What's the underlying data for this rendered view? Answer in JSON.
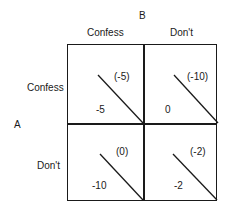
{
  "player_b": {
    "label": "B",
    "strategies": [
      "Confess",
      "Don't"
    ]
  },
  "player_a": {
    "label": "A",
    "strategies": [
      "Confess",
      "Don't"
    ]
  },
  "cells": [
    {
      "row": "Confess",
      "col": "Confess",
      "a_payoff": "-5",
      "b_payoff": "(-5)"
    },
    {
      "row": "Confess",
      "col": "Don't",
      "a_payoff": "0",
      "b_payoff": "(-10)"
    },
    {
      "row": "Don't",
      "col": "Confess",
      "a_payoff": "-10",
      "b_payoff": "(0)"
    },
    {
      "row": "Don't",
      "col": "Don't",
      "a_payoff": "-2",
      "b_payoff": "(-2)"
    }
  ],
  "colors": {
    "ink": "#1a1a1a",
    "background": "#ffffff"
  }
}
